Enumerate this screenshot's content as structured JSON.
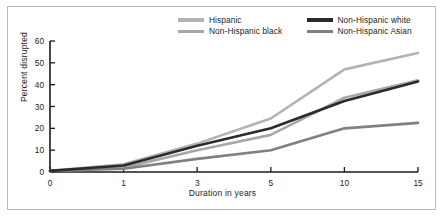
{
  "figure": {
    "border_color": "#b9b9bb",
    "background": "#ffffff"
  },
  "chart_data": {
    "type": "line",
    "title": "",
    "xlabel": "Duration in years",
    "ylabel": "Percent disrupted",
    "x": [
      0,
      1,
      3,
      5,
      10,
      15
    ],
    "x_tick_labels": [
      "0",
      "1",
      "3",
      "5",
      "10",
      "15"
    ],
    "y_tick_labels": [
      "0",
      "10",
      "20",
      "30",
      "40",
      "50",
      "60"
    ],
    "y_ticks": [
      0,
      10,
      20,
      30,
      40,
      50,
      60
    ],
    "ylim": [
      0,
      60
    ],
    "xlim": [
      0,
      15
    ],
    "grid": false,
    "legend_position": "top-center",
    "series": [
      {
        "name": "Hispanic",
        "color": "#b3b3b3",
        "values": [
          0.5,
          3.5,
          13.0,
          24.5,
          47.0,
          54.5
        ]
      },
      {
        "name": "Non-Hispanic black",
        "color": "#a8a8a8",
        "values": [
          0.5,
          2.0,
          10.0,
          17.0,
          34.0,
          42.0
        ]
      },
      {
        "name": "Non-Hispanic white",
        "color": "#2b2b2b",
        "values": [
          0.5,
          3.0,
          12.0,
          20.0,
          32.5,
          41.5
        ]
      },
      {
        "name": "Non-Hispanic Asian",
        "color": "#808080",
        "values": [
          0.5,
          1.5,
          6.0,
          10.0,
          20.0,
          22.5
        ]
      }
    ]
  },
  "legend": {
    "entries": [
      {
        "label": "Hispanic",
        "color": "#b3b3b3"
      },
      {
        "label": "Non-Hispanic white",
        "color": "#2b2b2b"
      },
      {
        "label": "Non-Hispanic black",
        "color": "#a8a8a8"
      },
      {
        "label": "Non-Hispanic Asian",
        "color": "#808080"
      }
    ]
  }
}
